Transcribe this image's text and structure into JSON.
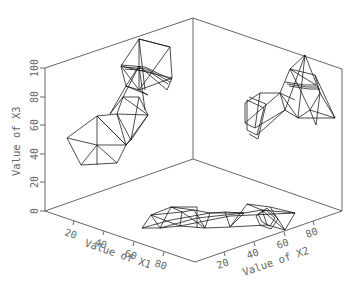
{
  "chart_data": {
    "type": "scatter",
    "subtype": "3d-projection-wireframe",
    "title": "",
    "axes": {
      "x1": {
        "label": "Value of X1",
        "ticks": [
          "20",
          "40",
          "60",
          "80"
        ],
        "range": [
          0,
          100
        ]
      },
      "x2": {
        "label": "Value of X2",
        "ticks": [
          "20",
          "40",
          "60",
          "80"
        ],
        "range": [
          0,
          100
        ]
      },
      "x3": {
        "label": "Value of X3",
        "ticks": [
          "0",
          "20",
          "40",
          "60",
          "80",
          "100"
        ],
        "range": [
          0,
          100
        ]
      }
    },
    "grid": false,
    "legend": null,
    "panels": [
      {
        "name": "left-wall",
        "projection": "X1 vs X3",
        "description": "chain of wireframe polyhedra rising from lower-left (X3≈40-60) to upper (X3≈85-100)"
      },
      {
        "name": "right-wall",
        "projection": "X2 vs X3",
        "description": "chain of wireframe polyhedra, X3 from ≈45 to ≈95"
      },
      {
        "name": "floor",
        "projection": "X1 vs X2",
        "description": "horizontal chain of wireframe polyhedra across X2 ≈ 5-70"
      }
    ],
    "colors": {
      "frame": "#555555",
      "wire": "#111111",
      "text": "#666666",
      "background": "#ffffff"
    }
  },
  "frame": {
    "lines": [
      [
        45,
        68,
        45,
        211
      ],
      [
        45,
        68,
        193,
        18
      ],
      [
        193,
        18,
        342,
        69
      ],
      [
        193,
        18,
        193,
        159
      ],
      [
        342,
        69,
        342,
        211
      ],
      [
        45,
        211,
        193,
        159
      ],
      [
        193,
        159,
        342,
        211
      ],
      [
        45,
        211,
        195,
        262
      ],
      [
        195,
        262,
        342,
        211
      ]
    ]
  },
  "x3_ticks": [
    {
      "label": "0",
      "y": 211
    },
    {
      "label": "20",
      "y": 182
    },
    {
      "label": "40",
      "y": 154
    },
    {
      "label": "60",
      "y": 125
    },
    {
      "label": "80",
      "y": 97
    },
    {
      "label": "100",
      "y": 68
    }
  ],
  "x1_ticks": [
    {
      "label": "20",
      "x": 74,
      "y": 221
    },
    {
      "label": "40",
      "x": 104,
      "y": 231
    },
    {
      "label": "60",
      "x": 134,
      "y": 242
    },
    {
      "label": "80",
      "x": 164,
      "y": 252
    }
  ],
  "x2_ticks": [
    {
      "label": "20",
      "x": 224,
      "y": 252
    },
    {
      "label": "40",
      "x": 254,
      "y": 242
    },
    {
      "label": "60",
      "x": 284,
      "y": 232
    },
    {
      "label": "80",
      "x": 313,
      "y": 221
    }
  ],
  "labels": {
    "x3": "Value of X3",
    "x1": "Value of X1",
    "x2": "Value of X2"
  },
  "wires": {
    "left": [
      [
        [
          67,
          138
        ],
        [
          81,
          165
        ],
        [
          117,
          163
        ],
        [
          126,
          145
        ],
        [
          97,
          116
        ],
        [
          67,
          138
        ]
      ],
      [
        [
          97,
          116
        ],
        [
          97,
          165
        ]
      ],
      [
        [
          67,
          138
        ],
        [
          97,
          145
        ]
      ],
      [
        [
          97,
          145
        ],
        [
          126,
          145
        ]
      ],
      [
        [
          97,
          145
        ],
        [
          81,
          165
        ]
      ],
      [
        [
          97,
          145
        ],
        [
          117,
          163
        ]
      ],
      [
        [
          97,
          116
        ],
        [
          126,
          145
        ]
      ],
      [
        [
          97,
          116
        ],
        [
          117,
          114
        ],
        [
          148,
          115
        ],
        [
          126,
          145
        ]
      ],
      [
        [
          117,
          114
        ],
        [
          126,
          145
        ]
      ],
      [
        [
          117,
          114
        ],
        [
          131,
          140
        ]
      ],
      [
        [
          148,
          115
        ],
        [
          131,
          140
        ]
      ],
      [
        [
          126,
          145
        ],
        [
          131,
          140
        ]
      ],
      [
        [
          117,
          114
        ],
        [
          123,
          97
        ],
        [
          139,
          97
        ],
        [
          148,
          115
        ]
      ],
      [
        [
          123,
          97
        ],
        [
          148,
          115
        ]
      ],
      [
        [
          139,
          97
        ],
        [
          131,
          140
        ]
      ],
      [
        [
          123,
          97
        ],
        [
          110,
          114
        ]
      ],
      [
        [
          110,
          114
        ],
        [
          126,
          86
        ],
        [
          148,
          95
        ]
      ],
      [
        [
          123,
          97
        ],
        [
          139,
          66
        ]
      ],
      [
        [
          139,
          66
        ],
        [
          145,
          110
        ]
      ],
      [
        [
          126,
          86
        ],
        [
          139,
          66
        ]
      ],
      [
        [
          139,
          66
        ],
        [
          167,
          90
        ],
        [
          172,
          78
        ],
        [
          170,
          47
        ],
        [
          139,
          39
        ],
        [
          121,
          66
        ],
        [
          126,
          86
        ]
      ],
      [
        [
          121,
          66
        ],
        [
          172,
          78
        ]
      ],
      [
        [
          121,
          66
        ],
        [
          139,
          90
        ]
      ],
      [
        [
          139,
          90
        ],
        [
          172,
          78
        ]
      ],
      [
        [
          139,
          39
        ],
        [
          139,
          90
        ]
      ],
      [
        [
          139,
          39
        ],
        [
          170,
          47
        ]
      ],
      [
        [
          139,
          39
        ],
        [
          145,
          90
        ]
      ],
      [
        [
          170,
          47
        ],
        [
          139,
          90
        ]
      ],
      [
        [
          121,
          65
        ],
        [
          145,
          67
        ],
        [
          172,
          80
        ]
      ],
      [
        [
          123,
          67
        ],
        [
          147,
          69
        ],
        [
          170,
          82
        ]
      ],
      [
        [
          125,
          69
        ],
        [
          148,
          71
        ],
        [
          168,
          84
        ]
      ],
      [
        [
          126,
          86
        ],
        [
          139,
          90
        ],
        [
          148,
          95
        ]
      ]
    ],
    "right": [
      [
        [
          245,
          103
        ],
        [
          260,
          93
        ],
        [
          255,
          128
        ],
        [
          245,
          123
        ],
        [
          245,
          103
        ]
      ],
      [
        [
          247,
          100
        ],
        [
          264,
          108
        ],
        [
          257,
          135
        ],
        [
          247,
          130
        ],
        [
          247,
          100
        ]
      ],
      [
        [
          249,
          97
        ],
        [
          266,
          104
        ],
        [
          258,
          139
        ],
        [
          249,
          134
        ]
      ],
      [
        [
          260,
          93
        ],
        [
          280,
          93
        ],
        [
          295,
          100
        ]
      ],
      [
        [
          245,
          123
        ],
        [
          280,
          93
        ]
      ],
      [
        [
          255,
          128
        ],
        [
          285,
          110
        ]
      ],
      [
        [
          257,
          135
        ],
        [
          285,
          110
        ]
      ],
      [
        [
          280,
          93
        ],
        [
          285,
          110
        ],
        [
          298,
          118
        ],
        [
          310,
          110
        ],
        [
          320,
          93
        ],
        [
          315,
          75
        ],
        [
          290,
          69
        ],
        [
          280,
          93
        ]
      ],
      [
        [
          290,
          69
        ],
        [
          305,
          55
        ],
        [
          320,
          93
        ]
      ],
      [
        [
          305,
          55
        ],
        [
          298,
          118
        ]
      ],
      [
        [
          305,
          55
        ],
        [
          285,
          110
        ]
      ],
      [
        [
          290,
          69
        ],
        [
          310,
          110
        ]
      ],
      [
        [
          285,
          82
        ],
        [
          305,
          85
        ],
        [
          316,
          85
        ]
      ],
      [
        [
          287,
          84
        ],
        [
          307,
          87
        ],
        [
          318,
          87
        ]
      ],
      [
        [
          289,
          86
        ],
        [
          309,
          89
        ],
        [
          320,
          89
        ]
      ],
      [
        [
          298,
          118
        ],
        [
          335,
          118
        ],
        [
          320,
          93
        ]
      ],
      [
        [
          310,
          110
        ],
        [
          335,
          118
        ]
      ],
      [
        [
          315,
          75
        ],
        [
          335,
          118
        ]
      ],
      [
        [
          320,
          93
        ],
        [
          316,
          125
        ]
      ],
      [
        [
          310,
          110
        ],
        [
          316,
          125
        ]
      ],
      [
        [
          280,
          93
        ],
        [
          298,
          118
        ]
      ],
      [
        [
          290,
          69
        ],
        [
          316,
          85
        ]
      ]
    ],
    "floor": [
      [
        [
          142,
          228
        ],
        [
          151,
          215
        ],
        [
          171,
          207
        ],
        [
          182,
          212
        ],
        [
          180,
          226
        ],
        [
          160,
          228
        ],
        [
          142,
          228
        ]
      ],
      [
        [
          151,
          215
        ],
        [
          160,
          228
        ]
      ],
      [
        [
          151,
          215
        ],
        [
          182,
          212
        ]
      ],
      [
        [
          171,
          207
        ],
        [
          160,
          228
        ]
      ],
      [
        [
          151,
          215
        ],
        [
          180,
          226
        ]
      ],
      [
        [
          171,
          207
        ],
        [
          194,
          210
        ],
        [
          210,
          213
        ],
        [
          205,
          228
        ],
        [
          180,
          226
        ]
      ],
      [
        [
          182,
          212
        ],
        [
          205,
          228
        ]
      ],
      [
        [
          194,
          210
        ],
        [
          182,
          212
        ]
      ],
      [
        [
          194,
          210
        ],
        [
          205,
          228
        ]
      ],
      [
        [
          171,
          207
        ],
        [
          197,
          207
        ]
      ],
      [
        [
          197,
          207
        ],
        [
          197,
          228
        ]
      ],
      [
        [
          210,
          213
        ],
        [
          225,
          212
        ],
        [
          244,
          213
        ],
        [
          230,
          227
        ],
        [
          205,
          228
        ]
      ],
      [
        [
          225,
          212
        ],
        [
          230,
          227
        ]
      ],
      [
        [
          210,
          213
        ],
        [
          244,
          213
        ]
      ],
      [
        [
          230,
          227
        ],
        [
          247,
          204
        ],
        [
          262,
          210
        ],
        [
          267,
          225
        ]
      ],
      [
        [
          244,
          213
        ],
        [
          262,
          210
        ]
      ],
      [
        [
          230,
          227
        ],
        [
          267,
          225
        ]
      ],
      [
        [
          247,
          204
        ],
        [
          270,
          207
        ],
        [
          295,
          213
        ],
        [
          285,
          230
        ],
        [
          267,
          225
        ]
      ],
      [
        [
          262,
          210
        ],
        [
          285,
          230
        ]
      ],
      [
        [
          270,
          207
        ],
        [
          285,
          230
        ]
      ],
      [
        [
          262,
          210
        ],
        [
          295,
          213
        ]
      ],
      [
        [
          258,
          214
        ],
        [
          262,
          222
        ],
        [
          270,
          226
        ],
        [
          275,
          218
        ],
        [
          266,
          210
        ],
        [
          258,
          214
        ]
      ],
      [
        [
          256,
          216
        ],
        [
          260,
          225
        ],
        [
          271,
          229
        ],
        [
          278,
          219
        ],
        [
          267,
          208
        ],
        [
          256,
          216
        ]
      ],
      [
        [
          142,
          228
        ],
        [
          171,
          220
        ],
        [
          210,
          213
        ]
      ],
      [
        [
          160,
          228
        ],
        [
          197,
          218
        ],
        [
          244,
          213
        ]
      ],
      [
        [
          180,
          226
        ],
        [
          230,
          216
        ],
        [
          295,
          213
        ]
      ]
    ]
  }
}
